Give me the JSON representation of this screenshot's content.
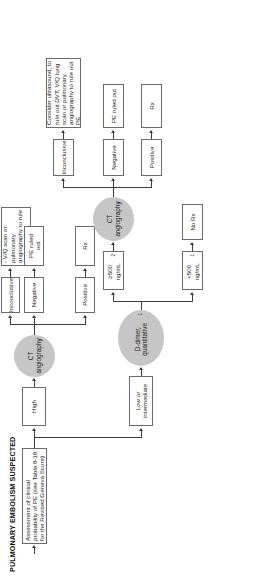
{
  "diagram": {
    "title": "PULMONARY EMBOLISM SUSPECTED",
    "assessment": "Assessment of clinical probability of PE (see Table 8-18 for the Revised Geneva Score)",
    "branch_high": "High",
    "branch_low": "Low or intermediate",
    "ct_angiography_high": "CT angiography",
    "ct_angiography_low": "CT angiography",
    "d_dimer": "D-dimer, quantitative",
    "d_dimer_sup": "1",
    "high_outcomes": {
      "positive": "Positive",
      "negative": "Negative",
      "inconclusive": "Inconclusive",
      "positive_action": "Rx",
      "negative_action": "PE ruled out",
      "inconclusive_action": "Consider\n- V/Q scan or pulmonary angiography to rule out PE\n- Empiric Rx"
    },
    "d_dimer_outcomes": {
      "low": "<500 ng/mL",
      "low_sup": "1",
      "low_action": "No Rx",
      "high": "≥500 ng/mL",
      "high_sup": "2"
    },
    "low_ct_outcomes": {
      "positive": "Positive",
      "negative": "Negative",
      "inconclusive": "Inconclusive",
      "positive_action": "Rx",
      "negative_action": "PE ruled out",
      "inconclusive_action": "Consider ultrasound, to rule out DVT, V/Q lung scan or pulmonary angiography to rule out PE"
    },
    "colors": {
      "oval_fill": "#c6c6c6",
      "box_border": "#6b6b6b",
      "connector": "#3e3e3e",
      "text": "#1a1a1a"
    }
  }
}
